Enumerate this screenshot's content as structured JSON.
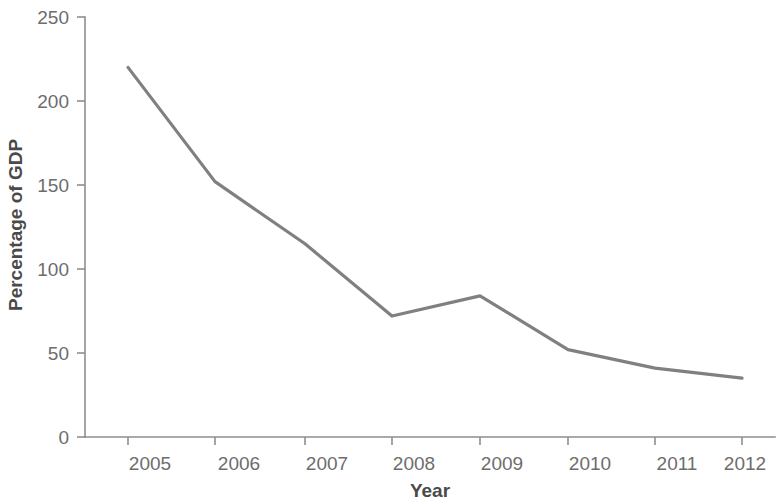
{
  "chart_data": {
    "type": "line",
    "title": "",
    "subtitle": "",
    "xlabel": "Year",
    "ylabel": "Percentage of GDP",
    "categories": [
      "2005",
      "2006",
      "2007",
      "2008",
      "2009",
      "2010",
      "2011",
      "2012"
    ],
    "x": [
      2005,
      2006,
      2007,
      2008,
      2009,
      2010,
      2011,
      2012
    ],
    "values": [
      220,
      152,
      115,
      72,
      84,
      52,
      41,
      35
    ],
    "series": [
      {
        "name": "Percentage of GDP",
        "values": [
          220,
          152,
          115,
          72,
          84,
          52,
          41,
          35
        ],
        "color": "#808080"
      }
    ],
    "xlim": [
      2004.5,
      2012.5
    ],
    "ylim": [
      0,
      250
    ],
    "y_ticks": [
      0,
      50,
      100,
      150,
      200,
      250
    ],
    "y_tick_labels": [
      "0",
      "50",
      "100",
      "150",
      "200",
      "250"
    ],
    "x_ticks": [
      2005,
      2006,
      2007,
      2008,
      2009,
      2010,
      2011,
      2012
    ],
    "x_tick_labels": [
      "2005",
      "2006",
      "2007",
      "2008",
      "2009",
      "2010",
      "2011",
      "2012"
    ],
    "grid": false,
    "legend": false,
    "legend_position": "none",
    "annotations": [],
    "line_color": "#808080",
    "axis_color": "#8e8e8e",
    "background_color": "#ffffff"
  }
}
